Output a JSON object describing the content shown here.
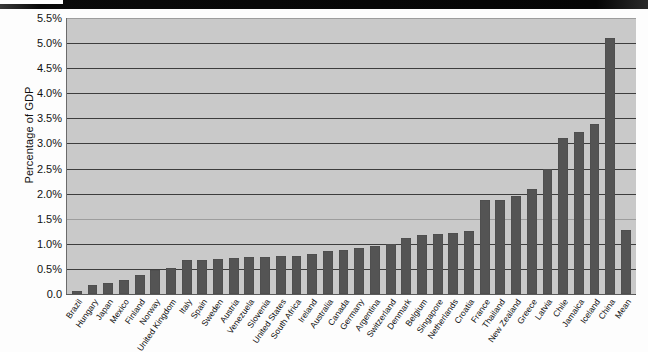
{
  "figure": {
    "background_color": "#fdfdfd",
    "plot_background_color": "#c9c9c9",
    "bar_color": "#545454",
    "gridline_color": "#3d3d3d",
    "scan_artifact_top_band": true
  },
  "axis": {
    "y_title": "Percentage of GDP",
    "y_ticks": [
      "5.5%",
      "5.0%",
      "4.5%",
      "4.0%",
      "3.5%",
      "3.0%",
      "2.5%",
      "2.0%",
      "1.5%",
      "1.0%",
      "0.5%",
      "0.0"
    ],
    "y_tick_values": [
      5.5,
      5.0,
      4.5,
      4.0,
      3.5,
      3.0,
      2.5,
      2.0,
      1.5,
      1.0,
      0.5,
      0.0
    ]
  },
  "chart_data": {
    "type": "bar",
    "title": "",
    "xlabel": "",
    "ylabel": "Percentage of GDP",
    "ylim": [
      0,
      5.5
    ],
    "ytick_interval": 0.5,
    "grid": true,
    "legend": "none",
    "orientation": "vertical",
    "sorted": "ascending (Mean appended last)",
    "categories": [
      "Brazil",
      "Hungary",
      "Japan",
      "Mexico",
      "Finland",
      "Norway",
      "United Kingdom",
      "Italy",
      "Spain",
      "Sweden",
      "Austria",
      "Venezuela",
      "Slovenia",
      "United States",
      "South Africa",
      "Ireland",
      "Australia",
      "Canada",
      "Germany",
      "Argentina",
      "Switzerland",
      "Denmark",
      "Belgium",
      "Singapore",
      "Netherlands",
      "Croatia",
      "France",
      "Thailand",
      "New Zealand",
      "Greece",
      "Latvia",
      "Chile",
      "Jamaica",
      "Iceland",
      "China",
      "Mean"
    ],
    "values": [
      0.07,
      0.18,
      0.22,
      0.28,
      0.37,
      0.48,
      0.51,
      0.67,
      0.67,
      0.7,
      0.71,
      0.73,
      0.73,
      0.76,
      0.76,
      0.8,
      0.85,
      0.88,
      0.92,
      0.95,
      1.0,
      1.12,
      1.17,
      1.2,
      1.22,
      1.25,
      1.88,
      1.88,
      1.95,
      2.1,
      2.5,
      3.1,
      3.22,
      3.38,
      5.1,
      1.28
    ],
    "value_unit": "percent of GDP"
  }
}
